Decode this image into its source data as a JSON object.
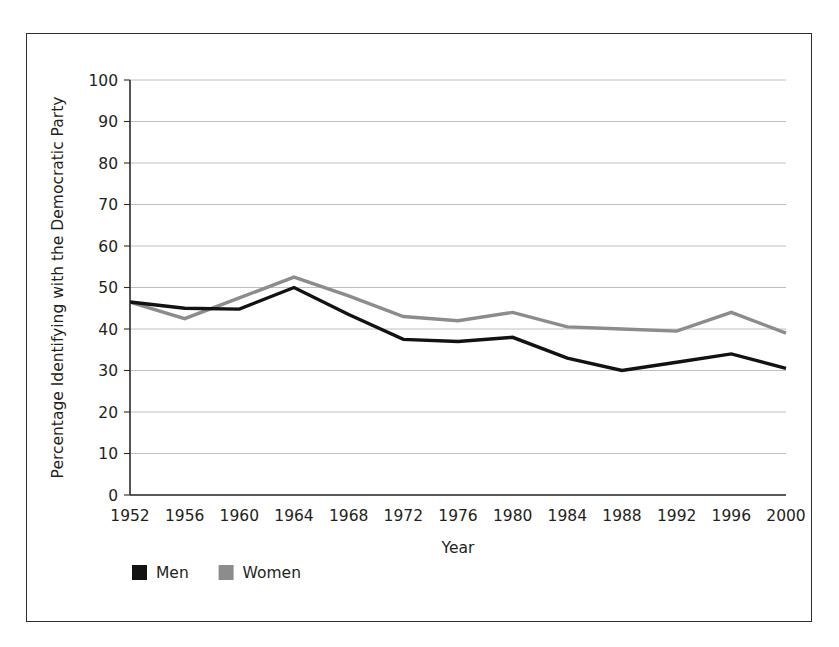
{
  "chart_data": {
    "type": "line",
    "title": "",
    "xlabel": "Year",
    "ylabel": "Percentage Identifying with the Democratic Party",
    "categories": [
      "1952",
      "1956",
      "1960",
      "1964",
      "1968",
      "1972",
      "1976",
      "1980",
      "1984",
      "1988",
      "1992",
      "1996",
      "2000"
    ],
    "x": [
      1952,
      1956,
      1960,
      1964,
      1968,
      1972,
      1976,
      1980,
      1984,
      1988,
      1992,
      1996,
      2000
    ],
    "series": [
      {
        "name": "Men",
        "color": "#121212",
        "values": [
          46.5,
          45.0,
          44.8,
          50.0,
          43.5,
          37.5,
          37.0,
          38.0,
          33.0,
          30.0,
          32.0,
          34.0,
          30.5
        ]
      },
      {
        "name": "Women",
        "color": "#8c8c8c",
        "values": [
          46.5,
          42.5,
          47.5,
          52.5,
          48.0,
          43.0,
          42.0,
          44.0,
          40.5,
          40.0,
          39.5,
          44.0,
          39.0
        ]
      }
    ],
    "ylim": [
      0,
      100
    ],
    "yticks": [
      0,
      10,
      20,
      30,
      40,
      50,
      60,
      70,
      80,
      90,
      100
    ],
    "ytick_labels": [
      "0",
      "10",
      "20",
      "30",
      "40",
      "50",
      "60",
      "70",
      "80",
      "90",
      "100"
    ],
    "grid": true,
    "grid_axis": "y",
    "grid_color": "#b9b9b9",
    "legend_position": "bottom-left",
    "axis_color": "#2b2b2b",
    "frame_color": "#2e2e2e",
    "background": "#ffffff"
  },
  "legend": {
    "entries": [
      {
        "label": "Men",
        "swatch_color": "#121212"
      },
      {
        "label": "Women",
        "swatch_color": "#8c8c8c"
      }
    ]
  }
}
